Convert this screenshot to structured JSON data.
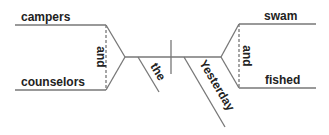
{
  "diagram": {
    "type": "sentence-diagram",
    "line_color": "#777777",
    "text_color": "#222222",
    "subjects": [
      "campers",
      "counselors"
    ],
    "subject_conjunction": "and",
    "modifiers": {
      "subject_modifier": "the",
      "verb_modifier": "Yesterday"
    },
    "predicates": [
      "swam",
      "fished"
    ],
    "predicate_conjunction": "and"
  }
}
